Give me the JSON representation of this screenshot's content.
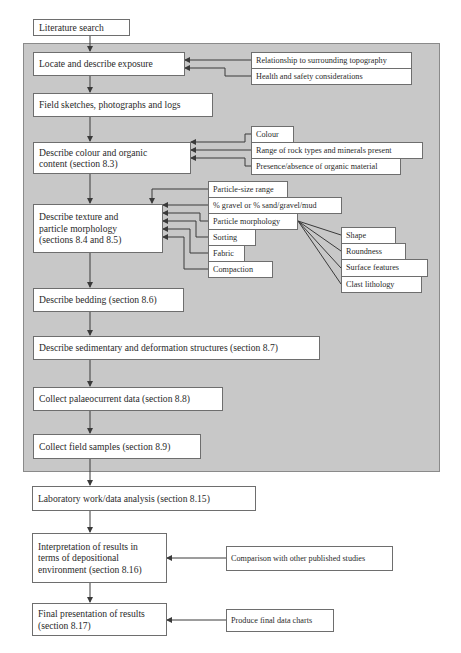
{
  "diagram": {
    "type": "flowchart",
    "colors": {
      "panel": "#c8c8c8",
      "box": "#ffffff",
      "line": "#3a3a3a",
      "border": "#6e6e6e"
    },
    "main_steps": [
      {
        "id": "literature",
        "label": "Literature search"
      },
      {
        "id": "locate",
        "label": "Locate and describe exposure"
      },
      {
        "id": "sketches",
        "label": "Field sketches, photographs and logs"
      },
      {
        "id": "colour",
        "label": "Describe colour and organic\ncontent (section 8.3)"
      },
      {
        "id": "texture",
        "label": "Describe texture and\nparticle morphology\n(sections 8.4 and 8.5)"
      },
      {
        "id": "bedding",
        "label": "Describe bedding (section 8.6)"
      },
      {
        "id": "structures",
        "label": "Describe sedimentary and deformation structures (section 8.7)"
      },
      {
        "id": "palaeocurrent",
        "label": "Collect palaeocurrent data (section 8.8)"
      },
      {
        "id": "samples",
        "label": "Collect field samples (section 8.9)"
      },
      {
        "id": "lab",
        "label": "Laboratory work/data analysis (section 8.15)"
      },
      {
        "id": "interpretation",
        "label": "Interpretation of results in\nterms of depositional\nenvironment (section 8.16)"
      },
      {
        "id": "final",
        "label": "Final presentation of results\n(section 8.17)"
      }
    ],
    "locate_inputs": [
      "Relationship to surrounding topography",
      "Health and safety considerations"
    ],
    "colour_inputs": [
      "Colour",
      "Range of rock types and minerals present",
      "Presence/absence of organic material"
    ],
    "texture_inputs": [
      "Particle-size range",
      "% gravel or % sand/gravel/mud",
      "Particle morphology",
      "Sorting",
      "Fabric",
      "Compaction"
    ],
    "morphology_inputs": [
      "Shape",
      "Roundness",
      "Surface features",
      "Clast lithology"
    ],
    "interpretation_inputs": [
      "Comparison with other published studies"
    ],
    "final_inputs": [
      "Produce final data charts"
    ]
  }
}
